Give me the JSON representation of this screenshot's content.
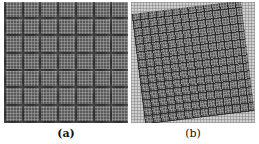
{
  "figure": {
    "panels": [
      {
        "id": "a",
        "caption": "(a)",
        "description": "Square grid pattern of 7x7 textured blocks with fine inner gridlines, axis-aligned"
      },
      {
        "id": "b",
        "caption": "(b)",
        "description": "Finer block grid pattern rotated slightly counter-clockwise over a light fine-grid background"
      }
    ],
    "colors": {
      "panel_a_fill": "#5a5a5a",
      "panel_b_background": "#cfcfcf",
      "panel_b_fill": "#5f5f5f",
      "caption_text": "#111111"
    }
  }
}
